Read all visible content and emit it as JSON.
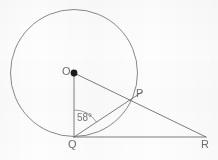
{
  "figure": {
    "kind": "geometry-diagram",
    "background_color": "#fdfdfd",
    "stroke_color": "#707070",
    "label_color": "#6e6e6e"
  },
  "points": {
    "center": {
      "label": "O",
      "x": 74,
      "y": 73,
      "dot": true,
      "dot_radius": 3.4,
      "label_x": 62,
      "label_y": 67
    },
    "tangent_point": {
      "label": "Q",
      "x": 74,
      "y": 137,
      "dot": false,
      "label_x": 69,
      "label_y": 141
    },
    "circle_point": {
      "label": "P",
      "x": 133,
      "y": 99,
      "dot": false,
      "label_x": 136,
      "label_y": 89
    },
    "outer_point": {
      "label": "R",
      "x": 206,
      "y": 137,
      "dot": false,
      "label_x": 202,
      "label_y": 141
    }
  },
  "circle": {
    "name": "main-circle",
    "cx": 74,
    "cy": 73,
    "r": 63.5,
    "stroke": "#787878",
    "stroke_width": 0.9,
    "fill": "none"
  },
  "segments": [
    {
      "name": "segment-OR",
      "from": "O",
      "to": "R",
      "x1": 74,
      "y1": 73,
      "x2": 206,
      "y2": 137,
      "stroke": "#6f6f6f",
      "stroke_width": 0.9
    },
    {
      "name": "segment-OQ",
      "from": "O",
      "to": "Q",
      "x1": 74,
      "y1": 73,
      "x2": 74,
      "y2": 137,
      "stroke": "#6f6f6f",
      "stroke_width": 0.9
    },
    {
      "name": "segment-QR",
      "from": "Q",
      "to": "R",
      "x1": 74,
      "y1": 137,
      "x2": 206,
      "y2": 137,
      "stroke": "#6f6f6f",
      "stroke_width": 0.9
    },
    {
      "name": "segment-QP",
      "from": "Q",
      "to": "P",
      "x1": 74,
      "y1": 137,
      "x2": 141,
      "y2": 93,
      "stroke": "#6f6f6f",
      "stroke_width": 0.9
    }
  ],
  "angle": {
    "name": "angle-OQP",
    "value": "58°",
    "vertex": "Q",
    "between": [
      "QO",
      "QP"
    ],
    "arc_radius": 27,
    "arc_path": "M 74 110 A 27 27 0 0 1 96.9 122.4",
    "label_x": 77,
    "label_y": 115,
    "stroke": "#8a8a8a"
  },
  "labels": {
    "o": "O",
    "p": "P",
    "q": "Q",
    "r": "R",
    "angle": "58°"
  }
}
